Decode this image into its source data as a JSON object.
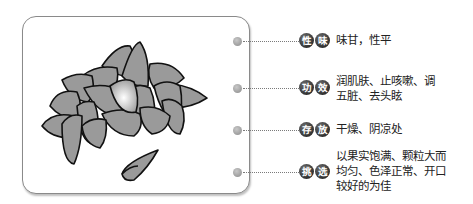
{
  "illustration": {
    "subject": "pile of pine nut kernels",
    "icon": "pine-nuts-illustration"
  },
  "properties": [
    {
      "key": "nature_flavor",
      "badge": [
        "性",
        "味"
      ],
      "lines": [
        "味甘，性平"
      ],
      "top": 37
    },
    {
      "key": "efficacy",
      "badge": [
        "功",
        "效"
      ],
      "lines": [
        "润肌肤、止咳嗽、调",
        "五脏、去头眩"
      ],
      "top": 83
    },
    {
      "key": "storage",
      "badge": [
        "存",
        "放"
      ],
      "lines": [
        "干燥、阴凉处"
      ],
      "top": 126
    },
    {
      "key": "selection",
      "badge": [
        "挑",
        "选"
      ],
      "lines": [
        "以果实饱满、颗粒大而",
        "均匀、色泽正常、开口",
        "较好的为佳"
      ],
      "top": 170
    }
  ],
  "colors": {
    "badge_bg": "#1a1a1a",
    "badge_text": "#ffffff",
    "text": "#222222",
    "frame_border": "#8a8a8a",
    "nut_fill": "#9a9a9a"
  }
}
